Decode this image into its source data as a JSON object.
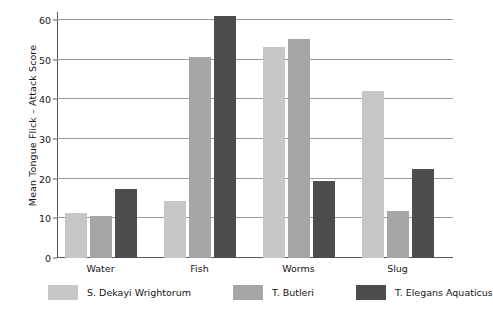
{
  "chart_data": {
    "type": "bar",
    "title": "",
    "subtitle": "",
    "xlabel": "",
    "ylabel": "Mean Tongue Flick – Attack Score",
    "ylim": [
      0,
      62
    ],
    "yticks": [
      0,
      10,
      20,
      30,
      40,
      50,
      60
    ],
    "ytick_labels": [
      "0",
      "10",
      "20",
      "30",
      "40",
      "50",
      "60"
    ],
    "grid": "horizontal",
    "legend_position": "bottom",
    "categories": [
      "Water",
      "Fish",
      "Worms",
      "Slug"
    ],
    "series": [
      {
        "name": "S. Dekayi Wrightorum",
        "color": "#c6c6c6",
        "values": [
          11.3,
          14.3,
          53.3,
          42.0
        ]
      },
      {
        "name": "T. Butleri",
        "color": "#a6a6a6",
        "values": [
          10.6,
          50.7,
          55.3,
          11.8
        ]
      },
      {
        "name": "T. Elegans Aquaticus",
        "color": "#4d4d4d",
        "values": [
          17.4,
          61.0,
          19.5,
          22.5
        ]
      }
    ]
  },
  "style": {
    "background": "#ffffff",
    "axis_color": "#5a5a5a",
    "gridline_color": "#9b9b9b",
    "text_color": "#161616"
  }
}
